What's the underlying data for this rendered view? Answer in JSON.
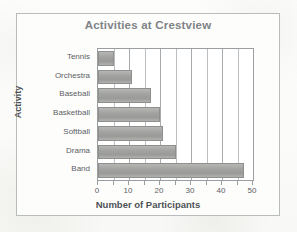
{
  "figure": {
    "background_color": "#fdfdfb",
    "frame_color": "#b9bcbd",
    "title": "Activities at Crestview",
    "title_color": "#7f8386"
  },
  "axes": {
    "x_axis_title": "Number of Participants",
    "y_axis_title": "Activity",
    "x_tick_labels": [
      "0",
      "10",
      "20",
      "30",
      "40",
      "50"
    ],
    "y_tick_labels": [
      "Tennis",
      "Orchestra",
      "Baseball",
      "Basketball",
      "Softball",
      "Drama",
      "Band"
    ],
    "gridline_interval": 5,
    "tick_interval": 5
  },
  "chart_data": {
    "type": "bar",
    "orientation": "horizontal",
    "title": "Activities at Crestview",
    "xlabel": "Number of Participants",
    "ylabel": "Activity",
    "categories": [
      "Tennis",
      "Orchestra",
      "Baseball",
      "Basketball",
      "Softball",
      "Drama",
      "Band"
    ],
    "values": [
      5,
      11,
      17,
      20,
      21,
      25,
      47
    ],
    "xlim": [
      0,
      50
    ],
    "xticks": [
      0,
      10,
      20,
      30,
      40,
      50
    ],
    "minor_xticks": [
      5,
      15,
      25,
      35,
      45
    ],
    "grid": true,
    "grid_axis": "x",
    "legend": false,
    "bar_color": "#a2a3a0",
    "bar_edge_color": "#8e908d"
  }
}
